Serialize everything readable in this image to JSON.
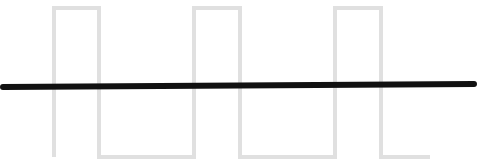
{
  "figure": {
    "width": 478,
    "height": 168,
    "background_color": "#ffffff"
  },
  "chart_data": {
    "type": "line",
    "title": "",
    "subtitle": "",
    "xlabel": "",
    "ylabel": "",
    "grid": false,
    "legend_position": "none",
    "axis_visible": false,
    "tick_labels_visible": false,
    "xlim": [
      0,
      478
    ],
    "ylim": [
      0,
      168
    ],
    "series": [
      {
        "name": "square-wave",
        "role": "digital-signal",
        "color": "#e0e0e0",
        "stroke_width": 4,
        "high_level_y": 8,
        "low_level_y": 157,
        "duty_cycle_percent": 32,
        "period_px": 140,
        "pulse_count": 3,
        "rising_edges_x": [
          54,
          194,
          335
        ],
        "falling_edges_x": [
          99,
          240,
          381
        ],
        "start_x": 54,
        "end_x": 430,
        "points": [
          [
            54,
            157
          ],
          [
            54,
            8
          ],
          [
            99,
            8
          ],
          [
            99,
            157
          ],
          [
            194,
            157
          ],
          [
            194,
            8
          ],
          [
            240,
            8
          ],
          [
            240,
            157
          ],
          [
            335,
            157
          ],
          [
            335,
            8
          ],
          [
            381,
            8
          ],
          [
            381,
            157
          ],
          [
            430,
            157
          ]
        ]
      },
      {
        "name": "baseline",
        "role": "reference-line",
        "color": "#111111",
        "stroke_width": 6,
        "points": [
          [
            3,
            87
          ],
          [
            474,
            84
          ]
        ],
        "start_x": 3,
        "end_x": 474,
        "start_y": 87,
        "end_y": 84
      }
    ],
    "annotations": []
  },
  "colors": {
    "wave": "#e0e0e0",
    "baseline": "#111111",
    "background": "#ffffff"
  }
}
